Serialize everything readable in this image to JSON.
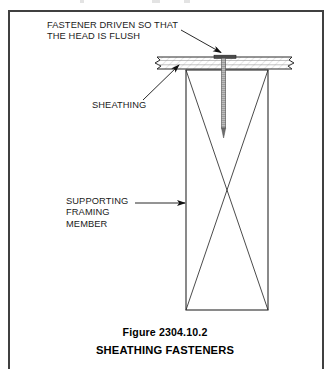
{
  "figure": {
    "frame_color": "#404040",
    "line_color": "#1a1a1a",
    "background": "#ffffff"
  },
  "annotations": {
    "fastener": {
      "line1": "FASTENER DRIVEN SO THAT",
      "line2": "THE HEAD IS FLUSH"
    },
    "sheathing": {
      "label": "SHEATHING"
    },
    "framing": {
      "line1": "SUPPORTING",
      "line2": "FRAMING",
      "line3": "MEMBER"
    }
  },
  "caption": {
    "figure_number": "Figure 2304.10.2",
    "title": "SHEATHING FASTENERS"
  }
}
